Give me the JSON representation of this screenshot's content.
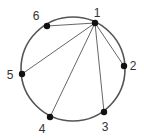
{
  "diagram": {
    "type": "circle-graph",
    "colors": {
      "circle": "#555555",
      "edge": "#555555",
      "node": "#111111",
      "label": "#333333"
    },
    "circle": {
      "cx": 73,
      "cy": 69,
      "r": 52
    },
    "nodes": [
      {
        "id": "1",
        "label": "1",
        "x": 95,
        "y": 23,
        "lx": 97,
        "ly": 17
      },
      {
        "id": "2",
        "label": "2",
        "x": 124,
        "y": 66,
        "lx": 133,
        "ly": 70
      },
      {
        "id": "3",
        "label": "3",
        "x": 104,
        "y": 112,
        "lx": 105,
        "ly": 131
      },
      {
        "id": "4",
        "label": "4",
        "x": 50,
        "y": 117,
        "lx": 42,
        "ly": 133
      },
      {
        "id": "5",
        "label": "5",
        "x": 22,
        "y": 74,
        "lx": 10,
        "ly": 79
      },
      {
        "id": "6",
        "label": "6",
        "x": 47,
        "y": 26,
        "lx": 36,
        "ly": 20
      }
    ],
    "edges": [
      [
        "1",
        "2"
      ],
      [
        "1",
        "3"
      ],
      [
        "1",
        "4"
      ],
      [
        "1",
        "5"
      ],
      [
        "1",
        "6"
      ]
    ]
  }
}
